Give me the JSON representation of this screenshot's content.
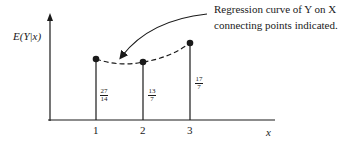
{
  "diagram": {
    "y_axis_label": "E(Y|x)",
    "x_axis_label": "x",
    "annotation": {
      "line1": "Regression curve of Y on X",
      "line2": "connecting points indicated."
    },
    "points": [
      {
        "x_label": "1",
        "value_num": "27",
        "value_den": "14"
      },
      {
        "x_label": "2",
        "value_num": "13",
        "value_den": "7"
      },
      {
        "x_label": "3",
        "value_num": "17",
        "value_den": "7"
      }
    ]
  }
}
